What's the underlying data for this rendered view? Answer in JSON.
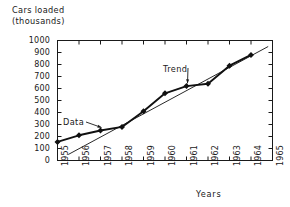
{
  "chart_data": {
    "type": "line",
    "title": "",
    "ylabel": "Cars loaded\n(thousands)",
    "ylabel_line1": "Cars loaded",
    "ylabel_line2": "(thousands)",
    "xlabel": "Years",
    "x": [
      1955,
      1956,
      1957,
      1958,
      1959,
      1960,
      1961,
      1962,
      1963,
      1964
    ],
    "categories": [
      "1955",
      "1956",
      "1957",
      "1958",
      "1959",
      "1960",
      "1961",
      "1962",
      "1963",
      "1964"
    ],
    "xtick_labels": [
      "1955",
      "1956",
      "1957",
      "1958",
      "1959",
      "1960",
      "1961",
      "1962",
      "1963",
      "1964",
      "1965"
    ],
    "ytick_labels": [
      "0",
      "100",
      "200",
      "300",
      "400",
      "500",
      "600",
      "700",
      "800",
      "900",
      "1000"
    ],
    "ytick_values": [
      0,
      100,
      200,
      300,
      400,
      500,
      600,
      700,
      800,
      900,
      1000
    ],
    "xlim": [
      1955,
      1965
    ],
    "ylim": [
      0,
      1000
    ],
    "grid": false,
    "legend": "none",
    "series": [
      {
        "name": "Data",
        "style": "line-with-markers",
        "marker": "filled-square",
        "color": "#111111",
        "values": [
          155,
          210,
          250,
          280,
          410,
          560,
          620,
          640,
          790,
          880
        ]
      },
      {
        "name": "Trend",
        "style": "straight-line",
        "color": "#111111",
        "x_endpoints": [
          1955.5,
          1964.8
        ],
        "y_endpoints": [
          50,
          950
        ]
      }
    ],
    "annotations": [
      {
        "text": "Data",
        "points_to_x": 1957,
        "points_to_y": 250
      },
      {
        "text": "Trend",
        "points_to_x": 1961,
        "points_to_y": 660
      }
    ]
  },
  "axis": {
    "frame_color": "#1a1a1a",
    "tick_direction": "inward"
  }
}
